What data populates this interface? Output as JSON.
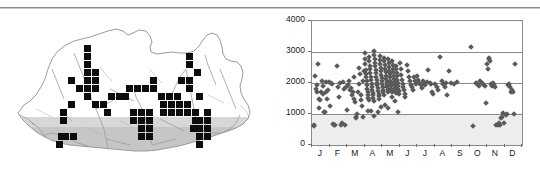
{
  "figure": {
    "panels": [
      "distribution-map",
      "elevation-scatter"
    ],
    "divider_color": "#8d8d8d"
  },
  "map": {
    "region_name": "Bhutan",
    "outline_color": "#9a9a9a",
    "relief_color": "#8c8c8c",
    "cell_color": "#0d0d0d",
    "cell_size_px": 7,
    "cells": [
      [
        84,
        36
      ],
      [
        84,
        44
      ],
      [
        84,
        52
      ],
      [
        84,
        60
      ],
      [
        92,
        60
      ],
      [
        84,
        68
      ],
      [
        92,
        68
      ],
      [
        68,
        68
      ],
      [
        76,
        76
      ],
      [
        84,
        76
      ],
      [
        92,
        76
      ],
      [
        84,
        84
      ],
      [
        68,
        92
      ],
      [
        92,
        92
      ],
      [
        100,
        92
      ],
      [
        108,
        84
      ],
      [
        116,
        84
      ],
      [
        122,
        84
      ],
      [
        126,
        76
      ],
      [
        134,
        76
      ],
      [
        142,
        76
      ],
      [
        150,
        76
      ],
      [
        104,
        100
      ],
      [
        60,
        100
      ],
      [
        60,
        108
      ],
      [
        58,
        124
      ],
      [
        62,
        124
      ],
      [
        70,
        124
      ],
      [
        56,
        132
      ],
      [
        150,
        68
      ],
      [
        158,
        84
      ],
      [
        166,
        84
      ],
      [
        174,
        84
      ],
      [
        160,
        92
      ],
      [
        168,
        92
      ],
      [
        176,
        92
      ],
      [
        184,
        92
      ],
      [
        160,
        100
      ],
      [
        168,
        100
      ],
      [
        130,
        100
      ],
      [
        138,
        100
      ],
      [
        146,
        100
      ],
      [
        138,
        108
      ],
      [
        146,
        108
      ],
      [
        130,
        108
      ],
      [
        138,
        116
      ],
      [
        146,
        116
      ],
      [
        138,
        124
      ],
      [
        146,
        124
      ],
      [
        176,
        100
      ],
      [
        184,
        100
      ],
      [
        192,
        100
      ],
      [
        192,
        108
      ],
      [
        186,
        44
      ],
      [
        186,
        52
      ],
      [
        194,
        60
      ],
      [
        186,
        68
      ],
      [
        186,
        76
      ],
      [
        178,
        68
      ],
      [
        196,
        84
      ],
      [
        204,
        100
      ],
      [
        204,
        108
      ],
      [
        196,
        108
      ],
      [
        196,
        116
      ],
      [
        204,
        116
      ],
      [
        196,
        124
      ],
      [
        204,
        124
      ],
      [
        196,
        132
      ],
      [
        190,
        116
      ]
    ]
  },
  "chart_data": {
    "type": "scatter",
    "title": "",
    "xlabel": "",
    "ylabel": "",
    "xlim": [
      0,
      12
    ],
    "ylim": [
      0,
      4000
    ],
    "yticks": [
      0,
      1000,
      2000,
      3000,
      4000
    ],
    "ytick_labels": [
      "0",
      "1000",
      "2000",
      "3000",
      "4000"
    ],
    "gridlines_y": [
      1000,
      2000,
      3000
    ],
    "grid": true,
    "legend": null,
    "categories": [
      "J",
      "F",
      "M",
      "A",
      "M",
      "J",
      "J",
      "A",
      "S",
      "O",
      "N",
      "D"
    ],
    "xtick_labels": [
      "J",
      "F",
      "M",
      "A",
      "M",
      "J",
      "J",
      "A",
      "S",
      "O",
      "N",
      "D"
    ],
    "marker": "diamond",
    "marker_color": "#5a5a5a",
    "shaded_band": {
      "from": 0,
      "to": 1000,
      "color": "#ededed"
    },
    "points": [
      [
        0.1,
        620
      ],
      [
        0.14,
        630
      ],
      [
        0.18,
        2240
      ],
      [
        0.22,
        1800
      ],
      [
        0.26,
        1950
      ],
      [
        0.3,
        1700
      ],
      [
        0.34,
        2620
      ],
      [
        0.38,
        1480
      ],
      [
        0.42,
        1180
      ],
      [
        0.46,
        1450
      ],
      [
        0.5,
        1720
      ],
      [
        0.55,
        2050
      ],
      [
        0.6,
        1900
      ],
      [
        0.64,
        1650
      ],
      [
        0.68,
        1060
      ],
      [
        0.72,
        1080
      ],
      [
        0.78,
        1700
      ],
      [
        0.82,
        2030
      ],
      [
        0.86,
        1500
      ],
      [
        0.9,
        1760
      ],
      [
        0.95,
        2040
      ],
      [
        1.05,
        1270
      ],
      [
        1.1,
        2000
      ],
      [
        1.16,
        1980
      ],
      [
        1.2,
        680
      ],
      [
        1.28,
        640
      ],
      [
        1.34,
        660
      ],
      [
        1.4,
        2560
      ],
      [
        1.46,
        1880
      ],
      [
        1.52,
        1560
      ],
      [
        1.58,
        1990
      ],
      [
        1.64,
        650
      ],
      [
        1.7,
        700
      ],
      [
        1.76,
        2020
      ],
      [
        1.82,
        1800
      ],
      [
        1.88,
        660
      ],
      [
        1.94,
        1860
      ],
      [
        2.02,
        1120
      ],
      [
        2.06,
        1930
      ],
      [
        2.12,
        2060
      ],
      [
        2.18,
        1760
      ],
      [
        2.24,
        1840
      ],
      [
        2.3,
        1600
      ],
      [
        2.34,
        1700
      ],
      [
        2.38,
        2180
      ],
      [
        2.42,
        1480
      ],
      [
        2.46,
        1380
      ],
      [
        2.5,
        900
      ],
      [
        2.54,
        860
      ],
      [
        2.58,
        1000
      ],
      [
        2.62,
        1700
      ],
      [
        2.66,
        1980
      ],
      [
        2.7,
        2500
      ],
      [
        2.74,
        2300
      ],
      [
        2.78,
        1600
      ],
      [
        2.82,
        1450
      ],
      [
        2.86,
        1250
      ],
      [
        2.9,
        910
      ],
      [
        2.94,
        2050
      ],
      [
        2.98,
        2400
      ],
      [
        3.0,
        2980
      ],
      [
        3.02,
        2760
      ],
      [
        3.04,
        2600
      ],
      [
        3.06,
        2420
      ],
      [
        3.08,
        2300
      ],
      [
        3.1,
        2180
      ],
      [
        3.12,
        2050
      ],
      [
        3.14,
        1950
      ],
      [
        3.16,
        1820
      ],
      [
        3.18,
        1700
      ],
      [
        3.2,
        1600
      ],
      [
        3.22,
        1520
      ],
      [
        3.24,
        1450
      ],
      [
        3.26,
        2850
      ],
      [
        3.28,
        2700
      ],
      [
        3.3,
        2560
      ],
      [
        3.32,
        2440
      ],
      [
        3.34,
        2330
      ],
      [
        3.36,
        2200
      ],
      [
        3.38,
        2090
      ],
      [
        3.4,
        1980
      ],
      [
        3.42,
        1880
      ],
      [
        3.44,
        1780
      ],
      [
        3.46,
        1690
      ],
      [
        3.48,
        1600
      ],
      [
        3.5,
        1510
      ],
      [
        3.52,
        1430
      ],
      [
        3.54,
        3020
      ],
      [
        3.56,
        2900
      ],
      [
        3.58,
        2780
      ],
      [
        3.6,
        2660
      ],
      [
        3.62,
        2540
      ],
      [
        3.64,
        2420
      ],
      [
        3.66,
        2310
      ],
      [
        3.68,
        2200
      ],
      [
        3.7,
        2100
      ],
      [
        3.72,
        2010
      ],
      [
        3.74,
        1920
      ],
      [
        3.76,
        1830
      ],
      [
        3.78,
        1750
      ],
      [
        3.8,
        1660
      ],
      [
        3.82,
        1580
      ],
      [
        3.84,
        1500
      ],
      [
        3.86,
        2880
      ],
      [
        3.88,
        2740
      ],
      [
        3.9,
        2620
      ],
      [
        3.92,
        2500
      ],
      [
        3.94,
        2380
      ],
      [
        3.96,
        2270
      ],
      [
        3.98,
        2160
      ],
      [
        4.0,
        2060
      ],
      [
        4.02,
        1960
      ],
      [
        4.04,
        1870
      ],
      [
        4.06,
        1780
      ],
      [
        4.08,
        1700
      ],
      [
        4.1,
        1620
      ],
      [
        4.12,
        2820
      ],
      [
        4.14,
        2700
      ],
      [
        4.16,
        2580
      ],
      [
        4.18,
        2460
      ],
      [
        4.2,
        2350
      ],
      [
        4.22,
        2240
      ],
      [
        4.24,
        2140
      ],
      [
        4.26,
        2040
      ],
      [
        4.28,
        1950
      ],
      [
        4.3,
        1860
      ],
      [
        4.32,
        1780
      ],
      [
        4.34,
        1700
      ],
      [
        4.36,
        2760
      ],
      [
        4.38,
        2640
      ],
      [
        4.4,
        2520
      ],
      [
        4.42,
        2400
      ],
      [
        4.44,
        2290
      ],
      [
        4.46,
        2180
      ],
      [
        4.48,
        2080
      ],
      [
        4.5,
        1980
      ],
      [
        4.52,
        1890
      ],
      [
        4.54,
        1800
      ],
      [
        4.56,
        1720
      ],
      [
        4.58,
        2700
      ],
      [
        4.6,
        2580
      ],
      [
        4.62,
        2460
      ],
      [
        4.64,
        2340
      ],
      [
        4.66,
        2230
      ],
      [
        4.68,
        2120
      ],
      [
        4.7,
        2020
      ],
      [
        4.72,
        1930
      ],
      [
        4.74,
        1840
      ],
      [
        4.76,
        1760
      ],
      [
        4.78,
        1680
      ],
      [
        4.8,
        2560
      ],
      [
        4.82,
        2440
      ],
      [
        4.84,
        2320
      ],
      [
        4.86,
        2210
      ],
      [
        4.88,
        2100
      ],
      [
        4.9,
        2000
      ],
      [
        4.92,
        1910
      ],
      [
        4.94,
        1820
      ],
      [
        4.96,
        1740
      ],
      [
        4.98,
        1660
      ],
      [
        3.2,
        1100
      ],
      [
        3.35,
        1090
      ],
      [
        3.55,
        940
      ],
      [
        3.75,
        1060
      ],
      [
        3.95,
        1210
      ],
      [
        4.15,
        1300
      ],
      [
        4.35,
        1180
      ],
      [
        4.55,
        1550
      ],
      [
        4.75,
        1430
      ],
      [
        4.92,
        1080
      ],
      [
        5.02,
        2650
      ],
      [
        5.06,
        2450
      ],
      [
        5.1,
        2250
      ],
      [
        5.14,
        2100
      ],
      [
        5.18,
        1980
      ],
      [
        5.22,
        1860
      ],
      [
        5.26,
        1760
      ],
      [
        5.3,
        1660
      ],
      [
        5.34,
        1560
      ],
      [
        5.4,
        2580
      ],
      [
        5.46,
        2380
      ],
      [
        5.52,
        2180
      ],
      [
        5.58,
        2050
      ],
      [
        5.64,
        1950
      ],
      [
        5.7,
        1870
      ],
      [
        5.76,
        1790
      ],
      [
        5.82,
        2200
      ],
      [
        5.88,
        2060
      ],
      [
        5.94,
        1960
      ],
      [
        6.02,
        2220
      ],
      [
        6.08,
        2100
      ],
      [
        6.14,
        2000
      ],
      [
        6.2,
        1920
      ],
      [
        6.26,
        1830
      ],
      [
        6.32,
        2080
      ],
      [
        6.4,
        2000
      ],
      [
        6.48,
        1950
      ],
      [
        6.56,
        2030
      ],
      [
        6.64,
        2420
      ],
      [
        6.72,
        2000
      ],
      [
        6.8,
        1960
      ],
      [
        6.88,
        1700
      ],
      [
        6.94,
        1640
      ],
      [
        7.04,
        1980
      ],
      [
        7.12,
        1860
      ],
      [
        7.2,
        1760
      ],
      [
        7.3,
        2830
      ],
      [
        7.4,
        2060
      ],
      [
        7.5,
        1960
      ],
      [
        7.58,
        1880
      ],
      [
        7.66,
        2000
      ],
      [
        7.74,
        1620
      ],
      [
        7.82,
        2400
      ],
      [
        7.92,
        2010
      ],
      [
        8.1,
        1980
      ],
      [
        8.3,
        2030
      ],
      [
        9.1,
        3160
      ],
      [
        9.2,
        600
      ],
      [
        9.35,
        2000
      ],
      [
        9.45,
        1980
      ],
      [
        9.55,
        1900
      ],
      [
        9.62,
        2050
      ],
      [
        9.7,
        2000
      ],
      [
        9.78,
        1960
      ],
      [
        9.86,
        1900
      ],
      [
        9.94,
        1340
      ],
      [
        10.02,
        2620
      ],
      [
        10.06,
        2450
      ],
      [
        10.1,
        2760
      ],
      [
        10.14,
        2820
      ],
      [
        10.18,
        2700
      ],
      [
        10.24,
        1980
      ],
      [
        10.3,
        1900
      ],
      [
        10.36,
        2000
      ],
      [
        10.42,
        1950
      ],
      [
        10.48,
        1880
      ],
      [
        10.54,
        640
      ],
      [
        10.6,
        660
      ],
      [
        10.66,
        700
      ],
      [
        10.72,
        660
      ],
      [
        10.8,
        860
      ],
      [
        10.86,
        900
      ],
      [
        10.92,
        1020
      ],
      [
        10.98,
        700
      ],
      [
        11.06,
        960
      ],
      [
        11.12,
        1000
      ],
      [
        11.18,
        1920
      ],
      [
        11.24,
        1960
      ],
      [
        11.3,
        1880
      ],
      [
        11.36,
        1720
      ],
      [
        11.42,
        1760
      ],
      [
        11.48,
        1700
      ],
      [
        11.54,
        1000
      ],
      [
        11.6,
        2620
      ]
    ]
  }
}
